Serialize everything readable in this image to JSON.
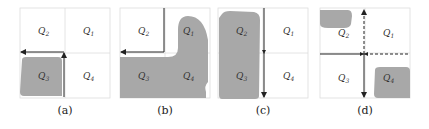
{
  "panels": [
    {
      "caption": "(a)",
      "labels": {
        "q1": "Q",
        "q1sub": "1",
        "q2": "Q",
        "q2sub": "2",
        "q3": "Q",
        "q3sub": "3",
        "q4": "Q",
        "q4sub": "4"
      }
    },
    {
      "caption": "(b)",
      "labels": {
        "q1": "Q",
        "q1sub": "1",
        "q2": "Q",
        "q2sub": "2",
        "q3": "Q",
        "q3sub": "3",
        "q4": "Q",
        "q4sub": "4"
      }
    },
    {
      "caption": "(c)",
      "labels": {
        "q1": "Q",
        "q1sub": "1",
        "q2": "Q",
        "q2sub": "2",
        "q3": "Q",
        "q3sub": "3",
        "q4": "Q",
        "q4sub": "4"
      }
    },
    {
      "caption": "(d)",
      "labels": {
        "q1": "Q",
        "q1sub": "1",
        "q2": "Q",
        "q2sub": "2",
        "q3": "Q",
        "q3sub": "3",
        "q4": "Q",
        "q4sub": "4"
      }
    }
  ],
  "colors": {
    "fill": "#a8a8a8",
    "grid": "#dddddd",
    "arrow": "#222222"
  }
}
